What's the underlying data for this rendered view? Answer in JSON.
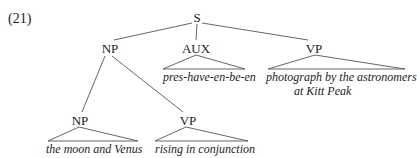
{
  "example_number": "(21)",
  "tree": {
    "root": {
      "label": "S"
    },
    "np": {
      "label": "NP",
      "np": {
        "label": "NP",
        "leaf": "the moon and Venus"
      },
      "vp": {
        "label": "VP",
        "leaf": "rising in conjunction"
      }
    },
    "aux": {
      "label": "AUX",
      "leaf": "pres-have-en-be-en"
    },
    "vp": {
      "label": "VP",
      "leaf_line1": "photograph by the astronomers",
      "leaf_line2": "at Kitt Peak"
    }
  },
  "colors": {
    "ink": "#1c1c1c",
    "line": "#555555",
    "background": "#ffffff"
  }
}
